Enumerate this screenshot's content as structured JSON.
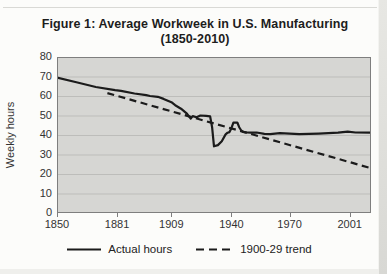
{
  "figure": {
    "title_line1": "Figure 1: Average Workweek in U.S. Manufacturing",
    "title_line2": "(1850-2010)"
  },
  "chart_data": {
    "type": "line",
    "title": "Figure 1: Average Workweek in U.S. Manufacturing (1850-2010)",
    "xlabel": "",
    "ylabel": "Weekly hours",
    "xlim": [
      1850,
      2012
    ],
    "ylim": [
      0,
      80
    ],
    "y_ticks": [
      0,
      10,
      20,
      30,
      40,
      50,
      60,
      70,
      80
    ],
    "x_ticks": [
      1850,
      1881,
      1909,
      1940,
      1970,
      2001
    ],
    "grid": "horizontal",
    "legend_position": "bottom",
    "colors": {
      "plot_bg": "#d6d6d3",
      "gridline": "#bdbdba",
      "plot_border": "#7e7e7e",
      "line": "#1b1b1b"
    },
    "series": [
      {
        "name": "Actual hours",
        "style": "solid",
        "points": [
          [
            1850,
            69.5
          ],
          [
            1860,
            67.0
          ],
          [
            1870,
            64.6
          ],
          [
            1880,
            63.0
          ],
          [
            1883,
            62.6
          ],
          [
            1890,
            61.3
          ],
          [
            1896,
            60.4
          ],
          [
            1898,
            60.0
          ],
          [
            1902,
            59.6
          ],
          [
            1905,
            58.5
          ],
          [
            1909,
            56.8
          ],
          [
            1911,
            55.3
          ],
          [
            1914,
            53.5
          ],
          [
            1917,
            51.0
          ],
          [
            1919,
            48.4
          ],
          [
            1920,
            49.7
          ],
          [
            1922,
            49.1
          ],
          [
            1924,
            50.0
          ],
          [
            1927,
            49.8
          ],
          [
            1929,
            49.6
          ],
          [
            1930,
            44.0
          ],
          [
            1931,
            34.2
          ],
          [
            1933,
            34.8
          ],
          [
            1935,
            36.8
          ],
          [
            1937,
            40.3
          ],
          [
            1938,
            41.2
          ],
          [
            1939,
            41.5
          ],
          [
            1940,
            43.5
          ],
          [
            1941,
            46.3
          ],
          [
            1943,
            46.4
          ],
          [
            1944,
            44.0
          ],
          [
            1945,
            42.4
          ],
          [
            1946,
            41.6
          ],
          [
            1948,
            41.3
          ],
          [
            1950,
            41.2
          ],
          [
            1953,
            41.3
          ],
          [
            1957,
            40.6
          ],
          [
            1960,
            40.4
          ],
          [
            1965,
            41.0
          ],
          [
            1970,
            40.7
          ],
          [
            1975,
            40.4
          ],
          [
            1980,
            40.6
          ],
          [
            1985,
            40.7
          ],
          [
            1990,
            40.9
          ],
          [
            1995,
            41.2
          ],
          [
            2000,
            41.7
          ],
          [
            2004,
            41.3
          ],
          [
            2012,
            41.2
          ]
        ]
      },
      {
        "name": "1900-29 trend",
        "style": "dashed",
        "points": [
          [
            1876,
            61.5
          ],
          [
            2012,
            23.0
          ]
        ]
      }
    ]
  }
}
